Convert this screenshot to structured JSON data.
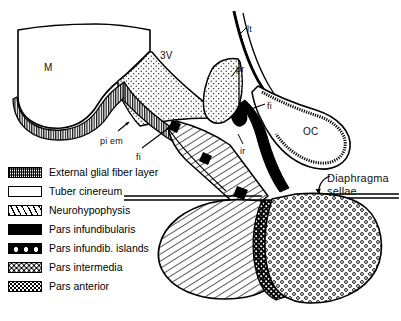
{
  "figure": {
    "background_color": "#ffffff",
    "line_color": "#000000"
  },
  "anatomy_labels": [
    {
      "key": "mammillary_body",
      "text": "M",
      "x": 44,
      "y": 62,
      "size": "big"
    },
    {
      "key": "third_ventricle",
      "text": "3V",
      "x": 160,
      "y": 50,
      "size": "big"
    },
    {
      "key": "lamina_terminalis",
      "text": "lt",
      "x": 247,
      "y": 24,
      "size": "small"
    },
    {
      "key": "preoptic_recess",
      "text": "pr",
      "x": 236,
      "y": 64,
      "size": "small"
    },
    {
      "key": "fibers_upper",
      "text": "fi",
      "x": 267,
      "y": 101,
      "size": "small"
    },
    {
      "key": "optic_chiasm",
      "text": "OC",
      "x": 303,
      "y": 126,
      "size": "big"
    },
    {
      "key": "pia_ependyma",
      "text": "pi em",
      "x": 100,
      "y": 136,
      "size": "small"
    },
    {
      "key": "fibers_lower",
      "text": "fi",
      "x": 136,
      "y": 152,
      "size": "small"
    },
    {
      "key": "infundibular_recess",
      "text": "ir",
      "x": 240,
      "y": 146,
      "size": "small"
    }
  ],
  "callouts": [
    {
      "key": "diaphragma-sellae",
      "line1": "Diaphragma",
      "line2": "sellae",
      "x": 327,
      "y": 172
    }
  ],
  "legend": {
    "items": [
      {
        "key": "external-glial-fiber-layer",
        "label": "External glial fiber layer",
        "swatch": "sw-glial",
        "pattern": "dense-horizontal-stipple"
      },
      {
        "key": "tuber-cinereum",
        "label": "Tuber cinereum",
        "swatch": "sw-tuber",
        "pattern": "fine-dot-stipple"
      },
      {
        "key": "neurohypophysis",
        "label": "Neurohypophysis",
        "swatch": "sw-neuro",
        "pattern": "diagonal-hatch"
      },
      {
        "key": "pars-infundibularis",
        "label": "Pars infundibularis",
        "swatch": "sw-parsinf",
        "pattern": "solid-black"
      },
      {
        "key": "pars-infundib-islands",
        "label": "Pars infundib. islands",
        "swatch": "sw-islands",
        "pattern": "black-with-white-ovals"
      },
      {
        "key": "pars-intermedia",
        "label": "Pars intermedia",
        "swatch": "sw-intermedia",
        "pattern": "black-with-white-dots"
      },
      {
        "key": "pars-anterior",
        "label": "Pars anterior",
        "swatch": "sw-anterior",
        "pattern": "open-circle-stipple"
      }
    ]
  }
}
